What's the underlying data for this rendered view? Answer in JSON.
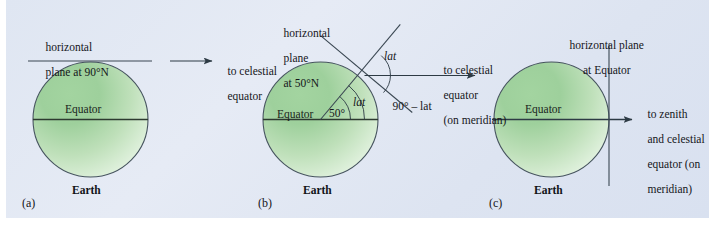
{
  "figure": {
    "background_color": "#dfe6f2",
    "earth_fill_start": "#8cc98c",
    "earth_fill_end": "#f2f8f2",
    "outline_color": "#3d4a52",
    "text_color": "#15161a"
  },
  "panels": [
    {
      "letter": "(a)",
      "earth_label": "Earth",
      "equator_label": "Equator",
      "horizontal_plane_label": "horizontal\nplane at 90°N",
      "horizontal_plane_line1": "horizontal",
      "horizontal_plane_line2": "plane at 90°N",
      "direction_label": "to celestial\nequator",
      "direction_line1": "to celestial",
      "direction_line2": "equator",
      "latitude": "90°N",
      "angles": []
    },
    {
      "letter": "(b)",
      "earth_label": "Earth",
      "equator_label": "Equator",
      "horizontal_plane_label": "horizontal\nplane\nat 50°N",
      "horizontal_plane_line1": "horizontal",
      "horizontal_plane_line2": "plane",
      "horizontal_plane_line3": "at 50°N",
      "direction_label": "to celestial\nequator\n(on meridian)",
      "direction_line1": "to celestial",
      "direction_line2": "equator",
      "direction_line3": "(on meridian)",
      "latitude": "50°N",
      "angles": [
        {
          "name": "center-angle",
          "value": "50°"
        },
        {
          "name": "lat-inner",
          "value": "lat"
        },
        {
          "name": "lat-upper",
          "value": "lat"
        },
        {
          "name": "complement",
          "value": "90° – lat"
        }
      ]
    },
    {
      "letter": "(c)",
      "earth_label": "Earth",
      "equator_label": "Equator",
      "horizontal_plane_label": "horizontal plane\nat Equator",
      "horizontal_plane_line1": "horizontal plane",
      "horizontal_plane_line2": "at Equator",
      "direction_label": "to zenith\nand celestial\nequator (on\nmeridian)",
      "direction_line1": "to zenith",
      "direction_line2": "and celestial",
      "direction_line3": "equator (on",
      "direction_line4": "meridian)",
      "latitude": "0°",
      "angles": []
    }
  ]
}
